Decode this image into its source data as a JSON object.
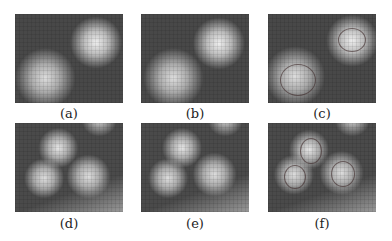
{
  "figure": {
    "panels": [
      {
        "id": "a",
        "caption": "(a)",
        "contour": false
      },
      {
        "id": "b",
        "caption": "(b)",
        "contour": false
      },
      {
        "id": "c",
        "caption": "(c)",
        "contour": true
      },
      {
        "id": "d",
        "caption": "(d)",
        "contour": false
      },
      {
        "id": "e",
        "caption": "(e)",
        "contour": false
      },
      {
        "id": "f",
        "caption": "(f)",
        "contour": true
      }
    ]
  }
}
